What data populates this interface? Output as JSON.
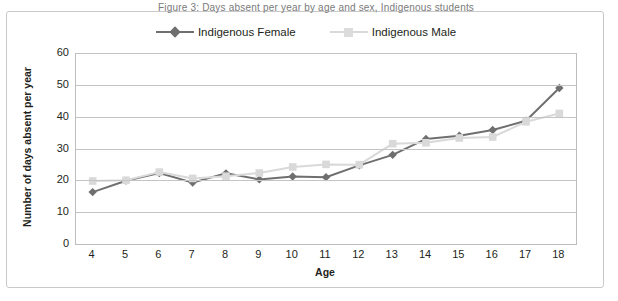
{
  "clipped_caption_text": "Figure 3: Days absent per year by age and sex, Indigenous students",
  "chart_data": {
    "type": "line",
    "title": "",
    "xlabel": "Age",
    "ylabel": "Number of days absent per year",
    "x": [
      4,
      5,
      6,
      7,
      8,
      9,
      10,
      11,
      12,
      13,
      14,
      15,
      16,
      17,
      18
    ],
    "xtick_labels": [
      "4",
      "5",
      "6",
      "7",
      "8",
      "9",
      "10",
      "11",
      "12",
      "13",
      "14",
      "15",
      "16",
      "17",
      "18"
    ],
    "ytick_labels": [
      "0",
      "10",
      "20",
      "30",
      "40",
      "50",
      "60"
    ],
    "yticks": [
      0,
      10,
      20,
      30,
      40,
      50,
      60
    ],
    "ylim": [
      0,
      60
    ],
    "grid": true,
    "legend_position": "top-center",
    "series": [
      {
        "name": "Indigenous Female",
        "color": "#6f6f6f",
        "marker": "diamond",
        "values": [
          16.3,
          19.9,
          22.3,
          19.3,
          22.2,
          20.3,
          21.2,
          21.0,
          24.7,
          28.0,
          33.0,
          34.0,
          35.8,
          38.7,
          49.0
        ]
      },
      {
        "name": "Indigenous Male",
        "color": "#d9d9d9",
        "marker": "square",
        "values": [
          19.8,
          20.0,
          22.6,
          20.6,
          21.3,
          22.3,
          24.2,
          25.0,
          24.9,
          31.5,
          31.8,
          33.3,
          33.6,
          38.4,
          41.0
        ]
      }
    ]
  },
  "legend": {
    "entries": [
      {
        "label": "Indigenous Female"
      },
      {
        "label": "Indigenous Male"
      }
    ]
  },
  "colors": {
    "female_line": "#6f6f6f",
    "male_line": "#d9d9d9",
    "gridline": "#c4c4c4",
    "frame_border": "#c9c9c9",
    "text": "#231f20"
  }
}
